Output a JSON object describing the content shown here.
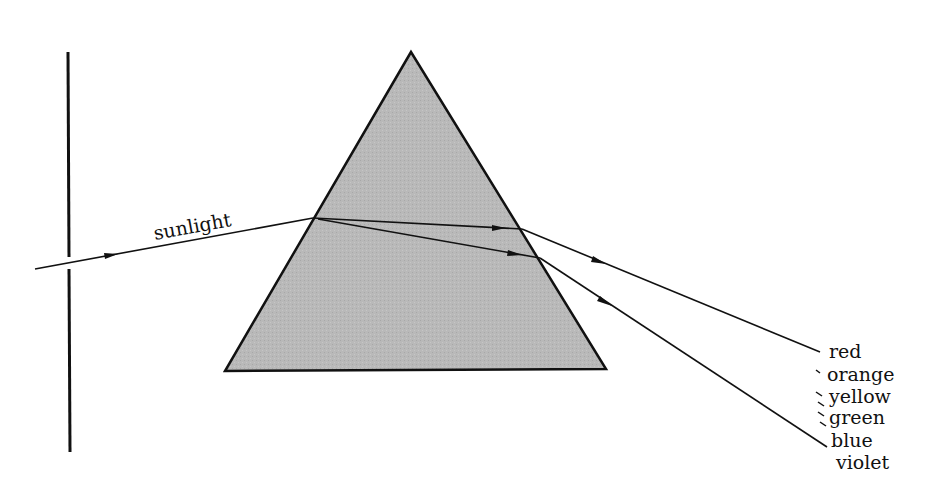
{
  "diagram": {
    "incoming_label": "sunlight",
    "spectrum_labels": [
      "red",
      "orange",
      "yellow",
      "green",
      "blue",
      "violet"
    ],
    "colors": {
      "line": "#111111",
      "prism_fill": "#b8b8b8",
      "background": "#ffffff"
    }
  }
}
